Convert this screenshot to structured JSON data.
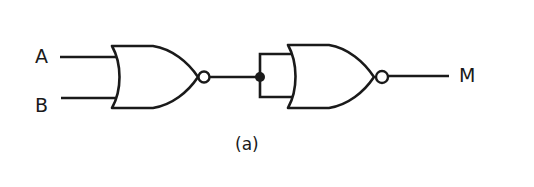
{
  "diagram": {
    "caption": "(a)",
    "inputs": [
      {
        "label": "A"
      },
      {
        "label": "B"
      }
    ],
    "output": {
      "label": "M"
    },
    "gates": [
      {
        "type": "NOR",
        "inputs": [
          "A",
          "B"
        ],
        "output": "A NOR B"
      },
      {
        "type": "NOR",
        "inputs": [
          "A NOR B",
          "A NOR B"
        ],
        "output": "M",
        "note": "inputs tied together (acts as inverter)"
      }
    ],
    "colors": {
      "stroke": "#1a1a1a",
      "background": "#ffffff"
    }
  }
}
